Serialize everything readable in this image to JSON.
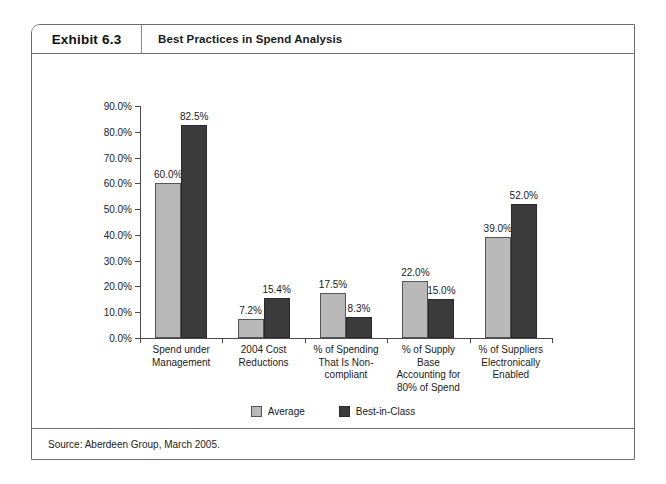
{
  "exhibit": {
    "tag": "Exhibit 6.3",
    "title": "Best Practices in Spend Analysis",
    "source": "Source: Aberdeen Group, March 2005."
  },
  "legend": {
    "items": [
      {
        "label": "Average",
        "color": "#b9b9b9",
        "swatch": "legend-swatch-average"
      },
      {
        "label": "Best-in-Class",
        "color": "#3b3b3b",
        "swatch": "legend-swatch-best-in-class"
      }
    ]
  },
  "axis": {
    "y_ticks": [
      "90.0%",
      "80.0%",
      "70.0%",
      "60.0%",
      "50.0%",
      "40.0%",
      "30.0%",
      "20.0%",
      "10.0%",
      "0.0%"
    ]
  },
  "chart_data": {
    "type": "bar",
    "title": "Best Practices in Spend Analysis",
    "xlabel": "",
    "ylabel": "",
    "ylim": [
      0,
      90
    ],
    "ytick_values": [
      0,
      10,
      20,
      30,
      40,
      50,
      60,
      70,
      80,
      90
    ],
    "ytick_labels": [
      "0.0%",
      "10.0%",
      "20.0%",
      "30.0%",
      "40.0%",
      "50.0%",
      "60.0%",
      "70.0%",
      "80.0%",
      "90.0%"
    ],
    "grid": false,
    "legend_position": "bottom",
    "categories": [
      "Spend under Management",
      "2004 Cost Reductions",
      "% of Spending That Is Non-compliant",
      "% of Supply Base Accounting for 80% of Spend",
      "% of Suppliers Electronically Enabled"
    ],
    "category_lines": [
      [
        "Spend under",
        "Management"
      ],
      [
        "2004 Cost",
        "Reductions"
      ],
      [
        "% of Spending",
        "That Is Non-",
        "compliant"
      ],
      [
        "% of Supply",
        "Base",
        "Accounting for",
        "80% of Spend"
      ],
      [
        "% of Suppliers",
        "Electronically",
        "Enabled"
      ]
    ],
    "series": [
      {
        "name": "Average",
        "color": "#b9b9b9",
        "values": [
          60.0,
          7.2,
          17.5,
          22.0,
          39.0
        ],
        "labels": [
          "60.0%",
          "7.2%",
          "17.5%",
          "22.0%",
          "39.0%"
        ]
      },
      {
        "name": "Best-in-Class",
        "color": "#3b3b3b",
        "values": [
          82.5,
          15.4,
          8.3,
          15.0,
          52.0
        ],
        "labels": [
          "82.5%",
          "15.4%",
          "8.3%",
          "15.0%",
          "52.0%"
        ]
      }
    ]
  }
}
